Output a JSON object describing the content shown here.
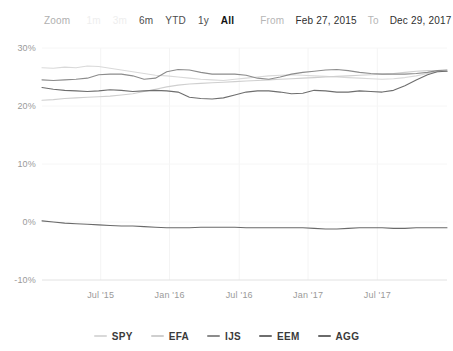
{
  "rangeselector": {
    "zoom_label": "Zoom",
    "buttons": [
      {
        "label": "1m",
        "state": "faded"
      },
      {
        "label": "3m",
        "state": "faded"
      },
      {
        "label": "6m",
        "state": "normal"
      },
      {
        "label": "YTD",
        "state": "normal"
      },
      {
        "label": "1y",
        "state": "normal"
      },
      {
        "label": "All",
        "state": "selected"
      }
    ],
    "from_label": "From",
    "from_value": "Feb 27, 2015",
    "to_label": "To",
    "to_value": "Dec 29, 2017"
  },
  "legend": {
    "position": "bottom",
    "items": [
      {
        "name": "SPY",
        "color": "#d9d9d9"
      },
      {
        "name": "EFA",
        "color": "#cfcfcf"
      },
      {
        "name": "IJS",
        "color": "#8c8c8c"
      },
      {
        "name": "EEM",
        "color": "#6e6e6e"
      },
      {
        "name": "AGG",
        "color": "#6a6a6a"
      }
    ]
  },
  "chart_data": {
    "type": "line",
    "title": "",
    "subtitle": "",
    "xlabel": "",
    "ylabel": "",
    "grid": true,
    "legend_position": "bottom",
    "xlim": [
      "2015-02-27",
      "2017-12-29"
    ],
    "ylim": [
      -10,
      30
    ],
    "ytick_values": [
      30,
      20,
      10,
      0,
      -10
    ],
    "ytick_labels": [
      "30%",
      "20%",
      "10%",
      "0%",
      "-10%"
    ],
    "xtick_labels": [
      "Jul '15",
      "Jan '16",
      "Jul '16",
      "Jan '17",
      "Jul '17"
    ],
    "xtick_positions": [
      0.145,
      0.315,
      0.487,
      0.657,
      0.828
    ],
    "x": [
      0.0,
      0.028,
      0.056,
      0.084,
      0.112,
      0.14,
      0.168,
      0.196,
      0.224,
      0.252,
      0.28,
      0.308,
      0.336,
      0.364,
      0.392,
      0.42,
      0.448,
      0.476,
      0.504,
      0.532,
      0.56,
      0.588,
      0.616,
      0.644,
      0.672,
      0.7,
      0.728,
      0.756,
      0.784,
      0.812,
      0.84,
      0.868,
      0.896,
      0.924,
      0.952,
      0.976,
      1.0
    ],
    "series": [
      {
        "name": "SPY",
        "color": "#d9d9d9",
        "values": [
          26.6,
          26.5,
          26.7,
          26.6,
          26.9,
          26.8,
          26.5,
          26.2,
          25.9,
          25.6,
          25.3,
          25.2,
          25.0,
          24.8,
          24.6,
          24.5,
          24.4,
          24.6,
          24.8,
          25.0,
          25.2,
          25.3,
          25.4,
          25.3,
          25.2,
          25.1,
          25.0,
          24.9,
          24.8,
          24.7,
          24.6,
          24.7,
          24.9,
          25.2,
          25.6,
          25.9,
          26.0
        ]
      },
      {
        "name": "EFA",
        "color": "#cfcfcf",
        "values": [
          21.0,
          21.1,
          21.3,
          21.4,
          21.5,
          21.6,
          21.7,
          21.9,
          22.1,
          22.5,
          22.9,
          23.3,
          23.6,
          23.8,
          23.9,
          24.0,
          24.1,
          24.2,
          24.3,
          24.4,
          24.5,
          24.6,
          24.7,
          24.8,
          24.9,
          25.0,
          25.1,
          25.2,
          25.3,
          25.4,
          25.5,
          25.6,
          25.8,
          26.0,
          26.1,
          26.1,
          26.0
        ]
      },
      {
        "name": "IJS",
        "color": "#8c8c8c",
        "values": [
          24.5,
          24.4,
          24.5,
          24.6,
          24.8,
          25.4,
          25.5,
          25.5,
          25.2,
          24.6,
          24.8,
          25.9,
          26.3,
          26.2,
          25.8,
          25.5,
          25.5,
          25.5,
          25.3,
          24.8,
          24.6,
          25.0,
          25.5,
          25.8,
          26.0,
          26.2,
          26.3,
          26.1,
          25.8,
          25.6,
          25.5,
          25.5,
          25.5,
          25.6,
          25.8,
          26.1,
          26.2
        ]
      },
      {
        "name": "EEM",
        "color": "#6e6e6e",
        "values": [
          23.2,
          22.9,
          22.7,
          22.6,
          22.5,
          22.6,
          22.8,
          22.7,
          22.5,
          22.6,
          22.7,
          22.6,
          22.4,
          21.5,
          21.3,
          21.2,
          21.4,
          21.9,
          22.4,
          22.6,
          22.6,
          22.4,
          22.1,
          22.2,
          22.7,
          22.6,
          22.4,
          22.4,
          22.6,
          22.5,
          22.4,
          22.7,
          23.5,
          24.5,
          25.4,
          25.9,
          26.0
        ]
      },
      {
        "name": "AGG",
        "color": "#6a6a6a",
        "values": [
          0.2,
          0.0,
          -0.2,
          -0.3,
          -0.4,
          -0.5,
          -0.6,
          -0.7,
          -0.7,
          -0.8,
          -0.9,
          -1.0,
          -1.0,
          -1.0,
          -0.9,
          -0.9,
          -0.9,
          -0.9,
          -1.0,
          -1.0,
          -1.0,
          -1.0,
          -1.0,
          -1.0,
          -1.1,
          -1.2,
          -1.2,
          -1.1,
          -1.0,
          -1.0,
          -1.0,
          -1.1,
          -1.1,
          -1.0,
          -1.0,
          -1.0,
          -1.0
        ]
      }
    ]
  }
}
